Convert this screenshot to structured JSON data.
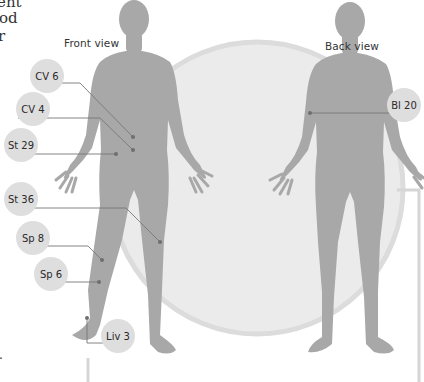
{
  "colors": {
    "background": "#ffffff",
    "circle_fill": "#ebebeb",
    "circle_rim": "#dcdcdc",
    "body_fill": "#a8a8a8",
    "leader_line": "#777777",
    "point_dot": "#6e6e6e",
    "bubble_fill": "#dedede",
    "bracket": "#d6d6d6"
  },
  "text_fragments": [
    "ent",
    "od",
    "r",
    "."
  ],
  "views": {
    "front": {
      "label": "Front view"
    },
    "back": {
      "label": "Back view"
    }
  },
  "points": [
    {
      "id": "cv6",
      "label": "CV 6",
      "view": "front"
    },
    {
      "id": "cv4",
      "label": "CV 4",
      "view": "front"
    },
    {
      "id": "st29",
      "label": "St 29",
      "view": "front"
    },
    {
      "id": "st36",
      "label": "St 36",
      "view": "front"
    },
    {
      "id": "sp8",
      "label": "Sp 8",
      "view": "front"
    },
    {
      "id": "sp6",
      "label": "Sp 6",
      "view": "front"
    },
    {
      "id": "liv3",
      "label": "Liv 3",
      "view": "front"
    },
    {
      "id": "bl20",
      "label": "Bl 20",
      "view": "back"
    }
  ]
}
